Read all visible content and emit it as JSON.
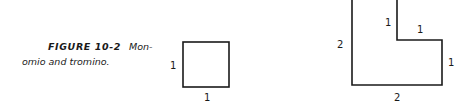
{
  "caption": {
    "figure_label": "FIGURE 10-2",
    "line1_text": "Mon-",
    "line2_text": "omio and tromino."
  },
  "monomino": {
    "side_left_label": "1",
    "side_bottom_label": "1"
  },
  "tromino": {
    "outer_left_label": "2",
    "outer_bottom_label": "2",
    "inner_vertical_label": "1",
    "inner_horizontal_label": "1",
    "right_label": "1"
  },
  "colors": {
    "stroke": "#1a1a1a",
    "background": "#ffffff"
  }
}
